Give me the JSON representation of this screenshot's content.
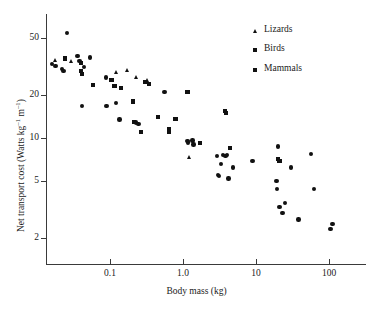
{
  "chart_data": {
    "type": "scatter",
    "title": "",
    "xlabel": "Body mass (kg)",
    "ylabel": "Net transport cost (Watts kg⁻¹ m⁻¹)",
    "ylabel_parts": {
      "pre": "Net transport cost (Watts kg",
      "sup1": "–1",
      "mid": " m",
      "sup2": "–1",
      "post": ")"
    },
    "xscale": "log",
    "yscale": "log",
    "xlim": [
      0.012,
      300
    ],
    "ylim": [
      1.5,
      70
    ],
    "grid": false,
    "legend_position": "top-right",
    "xticks": [
      {
        "value": 0.1,
        "label": "0.1"
      },
      {
        "value": 1.0,
        "label": "1.0"
      },
      {
        "value": 10,
        "label": "10"
      },
      {
        "value": 100,
        "label": "100"
      }
    ],
    "yticks": [
      {
        "value": 50,
        "label": "50"
      },
      {
        "value": 20,
        "label": "20"
      },
      {
        "value": 10,
        "label": "10"
      },
      {
        "value": 5,
        "label": "5"
      },
      {
        "value": 2,
        "label": "2"
      }
    ],
    "series": [
      {
        "name": "Lizards",
        "marker": "triangle",
        "color": "#111111",
        "points": [
          [
            0.018,
            35.0
          ],
          [
            0.03,
            34.5
          ],
          [
            0.125,
            29.0
          ],
          [
            0.175,
            30.0
          ],
          [
            0.23,
            26.5
          ],
          [
            0.33,
            25.5
          ],
          [
            1.25,
            7.3
          ]
        ]
      },
      {
        "name": "Birds",
        "marker": "square",
        "color": "#111111",
        "points": [
          [
            0.024,
            36.0
          ],
          [
            0.04,
            33.5
          ],
          [
            0.04,
            29.5
          ],
          [
            0.041,
            28.0
          ],
          [
            0.058,
            23.5
          ],
          [
            0.105,
            25.5
          ],
          [
            0.115,
            23.0
          ],
          [
            0.14,
            22.5
          ],
          [
            0.205,
            18.0
          ],
          [
            0.215,
            13.0
          ],
          [
            0.265,
            11.0
          ],
          [
            0.3,
            24.5
          ],
          [
            0.34,
            24.0
          ],
          [
            0.455,
            14.0
          ],
          [
            0.64,
            11.5
          ],
          [
            0.65,
            11.0
          ],
          [
            0.79,
            13.5
          ],
          [
            1.15,
            21.0
          ],
          [
            1.7,
            9.2
          ],
          [
            3.8,
            15.5
          ],
          [
            3.85,
            15.0
          ],
          [
            4.4,
            8.5
          ],
          [
            20.0,
            7.1
          ],
          [
            21.0,
            6.9
          ]
        ]
      },
      {
        "name": "Mammals",
        "marker": "circle",
        "color": "#111111",
        "points": [
          [
            0.026,
            54.0
          ],
          [
            0.016,
            33.0
          ],
          [
            0.018,
            32.0
          ],
          [
            0.022,
            30.5
          ],
          [
            0.023,
            29.5
          ],
          [
            0.036,
            37.5
          ],
          [
            0.038,
            34.5
          ],
          [
            0.044,
            31.5
          ],
          [
            0.053,
            36.5
          ],
          [
            0.041,
            16.8
          ],
          [
            0.088,
            26.5
          ],
          [
            0.09,
            16.8
          ],
          [
            0.12,
            17.5
          ],
          [
            0.135,
            13.5
          ],
          [
            0.225,
            12.8
          ],
          [
            0.245,
            12.5
          ],
          [
            0.56,
            21.0
          ],
          [
            1.15,
            9.5
          ],
          [
            1.18,
            9.3
          ],
          [
            1.35,
            9.6
          ],
          [
            1.4,
            9.0
          ],
          [
            2.9,
            7.5
          ],
          [
            3.0,
            5.5
          ],
          [
            3.1,
            5.4
          ],
          [
            3.3,
            6.6
          ],
          [
            3.55,
            7.6
          ],
          [
            3.8,
            7.5
          ],
          [
            4.0,
            7.6
          ],
          [
            4.2,
            5.2
          ],
          [
            4.8,
            6.2
          ],
          [
            9.0,
            6.9
          ],
          [
            19.0,
            5.0
          ],
          [
            19.5,
            4.4
          ],
          [
            20.0,
            8.7
          ],
          [
            21.0,
            3.3
          ],
          [
            23.0,
            3.0
          ],
          [
            25.0,
            3.5
          ],
          [
            30.0,
            6.2
          ],
          [
            38.0,
            2.7
          ],
          [
            57.0,
            7.7
          ],
          [
            62.0,
            4.4
          ],
          [
            105.0,
            2.3
          ],
          [
            112.0,
            2.5
          ]
        ]
      }
    ]
  }
}
